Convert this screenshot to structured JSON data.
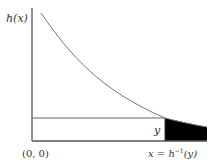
{
  "diagram": {
    "y_axis_label": "h(x)",
    "origin_label": "(0, 0)",
    "y_level_label": "y",
    "x_marker_label_prefix": "x = h",
    "x_marker_label_sup": "−1",
    "x_marker_label_suffix": "(y)",
    "colors": {
      "axis": "#555555",
      "curve": "#777777",
      "shade": "#000000",
      "background": "#ffffff"
    }
  }
}
